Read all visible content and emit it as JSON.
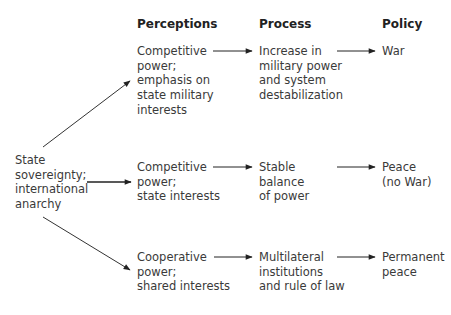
{
  "headers": {
    "perceptions": "Perceptions",
    "process": "Process",
    "policy": "Policy"
  },
  "source": {
    "lines": [
      "State",
      "sovereignty;",
      "international",
      "anarchy"
    ]
  },
  "rows": [
    {
      "perception": [
        "Competitive",
        "power;",
        "emphasis on",
        "state military",
        "interests"
      ],
      "process": [
        "Increase in",
        "military power",
        "and system",
        "destabilization"
      ],
      "policy": [
        "War"
      ]
    },
    {
      "perception": [
        "Competitive",
        "power;",
        "state interests"
      ],
      "process": [
        "Stable",
        "balance",
        "of power"
      ],
      "policy": [
        "Peace",
        "(no War)"
      ]
    },
    {
      "perception": [
        "Cooperative",
        "power;",
        "shared interests"
      ],
      "process": [
        "Multilateral",
        "institutions",
        "and rule of law"
      ],
      "policy": [
        "Permanent",
        "peace"
      ]
    }
  ],
  "colors": {
    "text": "#3a3a3a",
    "header": "#222222",
    "arrow": "#222222"
  }
}
